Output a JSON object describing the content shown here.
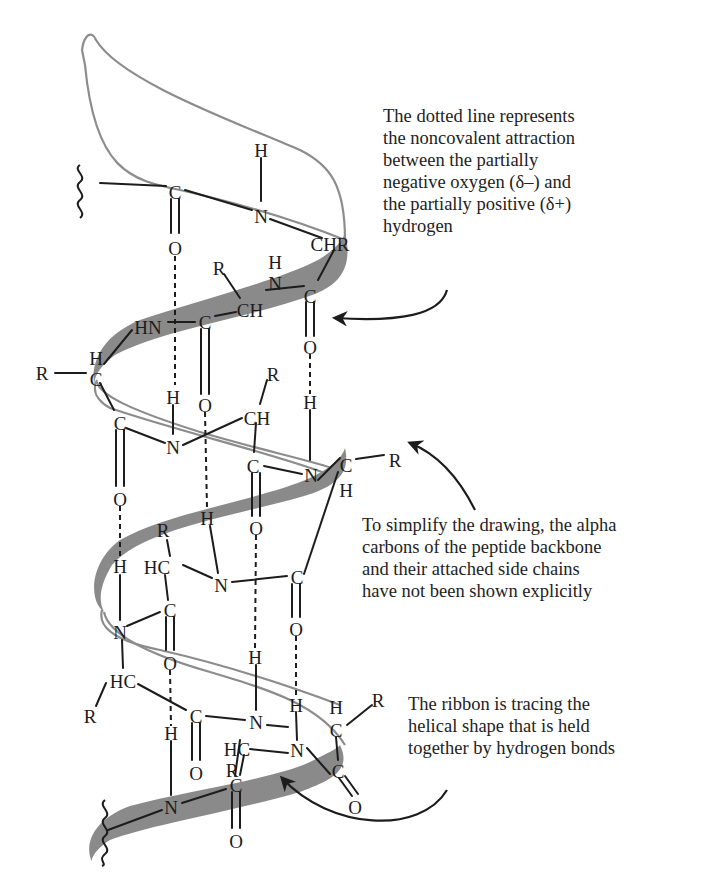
{
  "figure": {
    "colors": {
      "ribbon_front": "#8a8a8a",
      "ribbon_back_outline": "#8c8c8c",
      "ink": "#1c1c1c",
      "background": "#ffffff"
    },
    "callouts": [
      {
        "name": "dotted-line-callout",
        "lines": [
          "The dotted line represents",
          "the noncovalent attraction",
          "between the partially",
          "negative oxygen (δ–) and",
          "the partially positive (δ+)",
          "hydrogen"
        ]
      },
      {
        "name": "simplify-callout",
        "lines": [
          "To simplify the drawing, the alpha",
          "carbons of the peptide backbone",
          "and their attached side chains",
          "have not been shown explicitly"
        ]
      },
      {
        "name": "ribbon-callout",
        "lines": [
          "The ribbon is tracing the",
          "helical shape that is held",
          "together by hydrogen bonds"
        ]
      }
    ],
    "atoms": [
      {
        "t": "H",
        "x": 261,
        "y": 150
      },
      {
        "t": "C",
        "x": 175,
        "y": 192
      },
      {
        "t": "N",
        "x": 261,
        "y": 216
      },
      {
        "t": "CHR",
        "x": 330,
        "y": 244
      },
      {
        "t": "O",
        "x": 175,
        "y": 248
      },
      {
        "t": "H",
        "x": 275,
        "y": 262
      },
      {
        "t": "N",
        "x": 275,
        "y": 283
      },
      {
        "t": "R",
        "x": 219,
        "y": 268
      },
      {
        "t": "C",
        "x": 310,
        "y": 296
      },
      {
        "t": "CH",
        "x": 250,
        "y": 310
      },
      {
        "t": "HN",
        "x": 148,
        "y": 327
      },
      {
        "t": "C",
        "x": 205,
        "y": 322
      },
      {
        "t": "O",
        "x": 310,
        "y": 347
      },
      {
        "t": "H",
        "x": 96,
        "y": 358
      },
      {
        "t": "R",
        "x": 42,
        "y": 373
      },
      {
        "t": "C",
        "x": 96,
        "y": 379
      },
      {
        "t": "R",
        "x": 273,
        "y": 374
      },
      {
        "t": "H",
        "x": 173,
        "y": 397
      },
      {
        "t": "O",
        "x": 205,
        "y": 405
      },
      {
        "t": "H",
        "x": 310,
        "y": 402
      },
      {
        "t": "CH",
        "x": 257,
        "y": 418
      },
      {
        "t": "C",
        "x": 120,
        "y": 423
      },
      {
        "t": "N",
        "x": 173,
        "y": 447
      },
      {
        "t": "C",
        "x": 253,
        "y": 466
      },
      {
        "t": "N",
        "x": 311,
        "y": 475
      },
      {
        "t": "O",
        "x": 120,
        "y": 499
      },
      {
        "t": "H",
        "x": 207,
        "y": 518
      },
      {
        "t": "O",
        "x": 256,
        "y": 528
      },
      {
        "t": "R",
        "x": 163,
        "y": 530
      },
      {
        "t": "R",
        "x": 395,
        "y": 460
      },
      {
        "t": "C",
        "x": 346,
        "y": 465
      },
      {
        "t": "H",
        "x": 346,
        "y": 490
      },
      {
        "t": "H",
        "x": 120,
        "y": 566
      },
      {
        "t": "HC",
        "x": 157,
        "y": 567
      },
      {
        "t": "N",
        "x": 221,
        "y": 585
      },
      {
        "t": "C",
        "x": 297,
        "y": 577
      },
      {
        "t": "C",
        "x": 170,
        "y": 610
      },
      {
        "t": "N",
        "x": 120,
        "y": 632
      },
      {
        "t": "O",
        "x": 296,
        "y": 629
      },
      {
        "t": "O",
        "x": 170,
        "y": 663
      },
      {
        "t": "H",
        "x": 255,
        "y": 657
      },
      {
        "t": "HC",
        "x": 123,
        "y": 681
      },
      {
        "t": "C",
        "x": 196,
        "y": 716
      },
      {
        "t": "R",
        "x": 90,
        "y": 716
      },
      {
        "t": "N",
        "x": 256,
        "y": 722
      },
      {
        "t": "H",
        "x": 296,
        "y": 705
      },
      {
        "t": "H",
        "x": 336,
        "y": 707
      },
      {
        "t": "C",
        "x": 336,
        "y": 730
      },
      {
        "t": "R",
        "x": 378,
        "y": 700
      },
      {
        "t": "O",
        "x": 196,
        "y": 773
      },
      {
        "t": "R",
        "x": 232,
        "y": 770
      },
      {
        "t": "C",
        "x": 338,
        "y": 771
      },
      {
        "t": "H",
        "x": 171,
        "y": 733
      },
      {
        "t": "HC",
        "x": 237,
        "y": 749
      },
      {
        "t": "N",
        "x": 297,
        "y": 750
      },
      {
        "t": "O",
        "x": 355,
        "y": 807
      },
      {
        "t": "C",
        "x": 236,
        "y": 785
      },
      {
        "t": "N",
        "x": 171,
        "y": 807
      },
      {
        "t": "O",
        "x": 236,
        "y": 841
      }
    ]
  }
}
